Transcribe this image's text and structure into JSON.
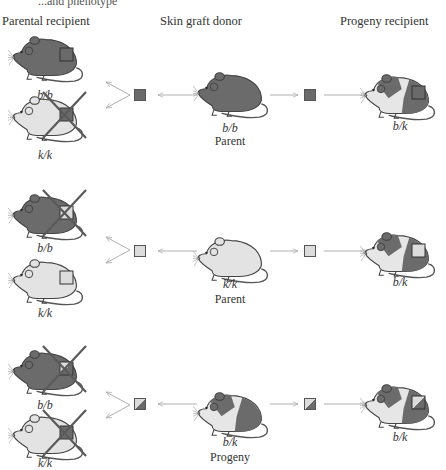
{
  "caption_fragment": "...and phenotype",
  "headers": {
    "left": "Parental recipient",
    "center": "Skin graft donor",
    "right": "Progeny recipient"
  },
  "colors": {
    "dark_mouse": "#6b6b6b",
    "light_mouse": "#e3e3e3",
    "outline": "#444444",
    "cross": "#5a5a5a",
    "arrow": "#b5b5b5",
    "graft_dark": "#6a6a6a",
    "graft_light": "#dcdcdc"
  },
  "rows": [
    {
      "donor": {
        "genotype": "b/b",
        "role": "Parent",
        "coat": "dark"
      },
      "graft": "dark",
      "parental_recipients": [
        {
          "genotype": "b/b",
          "coat": "dark",
          "graft": "dark",
          "rejected": false
        },
        {
          "genotype": "k/k",
          "coat": "light",
          "graft": "dark",
          "rejected": true
        }
      ],
      "progeny_recipient": {
        "genotype": "b/k",
        "coat": "patched",
        "graft": "dark",
        "rejected": false
      }
    },
    {
      "donor": {
        "genotype": "k/k",
        "role": "Parent",
        "coat": "light"
      },
      "graft": "light",
      "parental_recipients": [
        {
          "genotype": "b/b",
          "coat": "dark",
          "graft": "light",
          "rejected": true
        },
        {
          "genotype": "k/k",
          "coat": "light",
          "graft": "light",
          "rejected": false
        }
      ],
      "progeny_recipient": {
        "genotype": "b/k",
        "coat": "patched",
        "graft": "light",
        "rejected": false
      }
    },
    {
      "donor": {
        "genotype": "b/k",
        "role": "Progeny",
        "coat": "patched"
      },
      "graft": "split",
      "parental_recipients": [
        {
          "genotype": "b/b",
          "coat": "dark",
          "graft": "split",
          "rejected": true
        },
        {
          "genotype": "k/k",
          "coat": "light",
          "graft": "split",
          "rejected": true
        }
      ],
      "progeny_recipient": {
        "genotype": "b/k",
        "coat": "patched",
        "graft": "split",
        "rejected": false
      }
    }
  ]
}
